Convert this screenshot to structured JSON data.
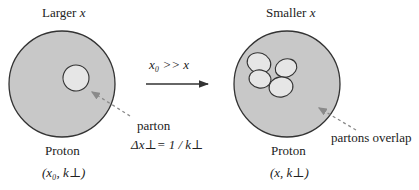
{
  "left": {
    "title_prefix": "Larger ",
    "title_var": "x",
    "label": "Proton",
    "coords": "(x₀, k⊥)",
    "parton_label": "parton",
    "parton_size": "Δx⊥= 1 / k⊥"
  },
  "arrow": {
    "label": "x₀  >>  x"
  },
  "right": {
    "title_prefix": "Smaller ",
    "title_var": "x",
    "label": "Proton",
    "coords": "(x, k⊥)",
    "overlap_label": "partons overlap"
  },
  "colors": {
    "proton_fill": "#c8c8c8",
    "parton_fill": "#e6e6e6",
    "stroke": "#333333",
    "pointer": "#8a8a8a"
  }
}
